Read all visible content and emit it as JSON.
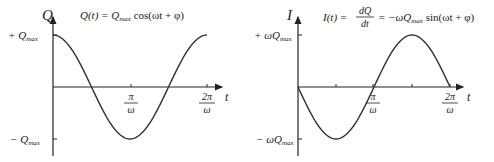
{
  "chart_data": [
    {
      "type": "line",
      "title": "Q(t) = Q_max cos(ωt + φ)",
      "xlabel": "t",
      "ylabel": "Q",
      "x_ticks": [
        "π/ω",
        "2π/ω"
      ],
      "y_ticks": [
        "+Q_max",
        "−Q_max"
      ],
      "x": [
        0,
        0.25,
        0.5,
        0.75,
        1.0,
        1.25,
        1.5,
        1.75,
        2.0
      ],
      "x_units": "π/ω",
      "series": [
        {
          "name": "Q(t)",
          "values": [
            1,
            0.707,
            0,
            -0.707,
            -1,
            -0.707,
            0,
            0.707,
            1
          ]
        }
      ],
      "y_units": "Q_max",
      "ylim": [
        -1,
        1
      ],
      "grid": false
    },
    {
      "type": "line",
      "title": "I(t) = dQ/dt = −ωQ_max sin(ωt + φ)",
      "xlabel": "t",
      "ylabel": "I",
      "x_ticks": [
        "π/ω",
        "2π/ω"
      ],
      "y_ticks": [
        "+ωQ_max",
        "−ωQ_max"
      ],
      "x": [
        0,
        0.25,
        0.5,
        0.75,
        1.0,
        1.25,
        1.5,
        1.75,
        2.0
      ],
      "x_units": "π/ω",
      "series": [
        {
          "name": "I(t)",
          "values": [
            0,
            -0.707,
            -1,
            -0.707,
            0,
            0.707,
            1,
            0.707,
            0
          ]
        }
      ],
      "y_units": "ωQ_max",
      "ylim": [
        -1,
        1
      ],
      "grid": false
    }
  ],
  "left": {
    "ylabel": "Q",
    "xlabel": "t",
    "eq_lhs": "Q(t) = Q",
    "eq_sub": "max",
    "eq_rhs": " cos(ωt + φ)",
    "ytick_pos_sign": "+ Q",
    "ytick_neg_sign": "− Q",
    "ytick_sub": "max",
    "xtick1_num": "π",
    "xtick2_num": "2π",
    "xtick_den": "ω"
  },
  "right": {
    "ylabel": "I",
    "xlabel": "t",
    "eq_lhs": "I(t) =",
    "eq_frac_num": "dQ",
    "eq_frac_den": "dt",
    "eq_mid": "= −ωQ",
    "eq_sub": "max",
    "eq_rhs": " sin(ωt + φ)",
    "ytick_pos_sign": "+ ωQ",
    "ytick_neg_sign": "− ωQ",
    "ytick_sub": "max",
    "xtick1_num": "π",
    "xtick2_num": "2π",
    "xtick_den": "ω"
  }
}
